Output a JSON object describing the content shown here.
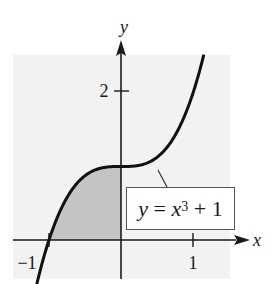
{
  "chart_data": {
    "type": "line",
    "title": "",
    "function": "y = x^3 + 1",
    "xlabel": "x",
    "ylabel": "y",
    "x_ticks": [
      {
        "value": -1,
        "label": "−1"
      },
      {
        "value": 1,
        "label": "1"
      }
    ],
    "y_ticks": [
      {
        "value": 2,
        "label": "2"
      }
    ],
    "xlim": [
      -1.5,
      1.5
    ],
    "ylim": [
      -0.55,
      2.5
    ],
    "grid": false,
    "series": [
      {
        "name": "y = x^3 + 1",
        "x": [
          -1.17,
          -1.0,
          -0.75,
          -0.5,
          -0.25,
          0,
          0.25,
          0.5,
          0.75,
          1.0,
          1.15
        ],
        "y": [
          -0.6,
          0,
          0.578,
          0.875,
          0.984,
          1,
          1.016,
          1.125,
          1.422,
          2,
          2.52
        ]
      }
    ],
    "shaded_region": {
      "from_x": -1,
      "to_x": 0,
      "under": "y = x^3 + 1",
      "above": "x-axis",
      "color": "#c4c4c4"
    },
    "annotations": [
      {
        "text": "y = x³ + 1",
        "points_to_x": 0.5,
        "boxed": true
      }
    ],
    "background_color": "#f2f2f2"
  },
  "labels": {
    "x_axis": "x",
    "y_axis": "y",
    "tick_neg1": "−1",
    "tick_1": "1",
    "tick_2": "2",
    "eq_y": "y",
    "eq_eq": " = ",
    "eq_x": "x",
    "eq_exp": "3",
    "eq_rest": " + 1"
  }
}
